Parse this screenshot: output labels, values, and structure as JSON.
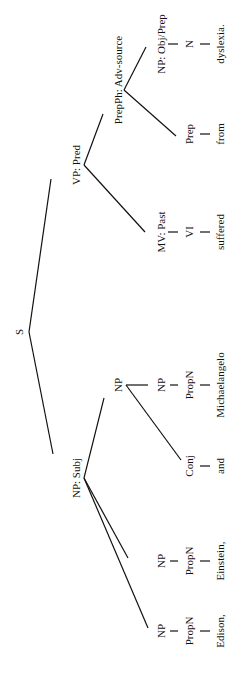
{
  "diagram": {
    "type": "syntax-tree",
    "orientation": "rotated-90-clockwise",
    "cropped_header_text": "",
    "nodes": {
      "s": "S",
      "np_subj": "NP: Subj",
      "vp_pred": "VP: Pred",
      "np1": "NP",
      "propn1": "PropN",
      "word_edison": "Edison,",
      "np2": "NP",
      "propn2": "PropN",
      "word_einstein": "Einstein,",
      "np3": "NP",
      "conj": "Conj",
      "word_and": "and",
      "np4": "NP",
      "propn3": "PropN",
      "word_michaelangelo": "Michaelangelo",
      "mv_past": "MV: Past",
      "vi": "VI",
      "word_suffered": "suffered",
      "prepph": "PrepPh: Adv-source",
      "prep": "Prep",
      "word_from": "from",
      "np_obj": "NP: Obj/Prep",
      "n": "N",
      "word_dyslexia": "dyslexia."
    }
  }
}
